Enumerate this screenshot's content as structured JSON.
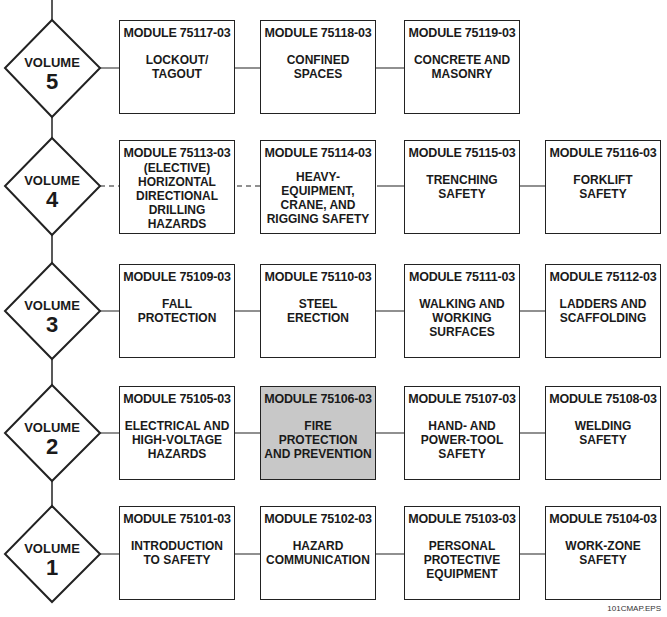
{
  "diagram": {
    "type": "course-map",
    "volumes": [
      {
        "label": "VOLUME",
        "number": "5",
        "modules": [
          {
            "code": "MODULE 75117-03",
            "title": "LOCKOUT/\nTAGOUT"
          },
          {
            "code": "MODULE 75118-03",
            "title": "CONFINED\nSPACES"
          },
          {
            "code": "MODULE 75119-03",
            "title": "CONCRETE AND\nMASONRY"
          }
        ]
      },
      {
        "label": "VOLUME",
        "number": "4",
        "modules": [
          {
            "code": "MODULE 75113-03",
            "title": "(ELECTIVE)\nHORIZONTAL\nDIRECTIONAL\nDRILLING\nHAZARDS",
            "elective": true
          },
          {
            "code": "MODULE 75114-03",
            "title": "HEAVY-\nEQUIPMENT,\nCRANE, AND\nRIGGING SAFETY"
          },
          {
            "code": "MODULE 75115-03",
            "title": "TRENCHING\nSAFETY"
          },
          {
            "code": "MODULE 75116-03",
            "title": "FORKLIFT\nSAFETY"
          }
        ]
      },
      {
        "label": "VOLUME",
        "number": "3",
        "modules": [
          {
            "code": "MODULE 75109-03",
            "title": "FALL\nPROTECTION"
          },
          {
            "code": "MODULE 75110-03",
            "title": "STEEL\nERECTION"
          },
          {
            "code": "MODULE 75111-03",
            "title": "WALKING AND\nWORKING\nSURFACES"
          },
          {
            "code": "MODULE 75112-03",
            "title": "LADDERS AND\nSCAFFOLDING"
          }
        ]
      },
      {
        "label": "VOLUME",
        "number": "2",
        "modules": [
          {
            "code": "MODULE 75105-03",
            "title": "ELECTRICAL AND\nHIGH-VOLTAGE\nHAZARDS"
          },
          {
            "code": "MODULE 75106-03",
            "title": "FIRE\nPROTECTION\nAND PREVENTION",
            "highlighted": true
          },
          {
            "code": "MODULE 75107-03",
            "title": "HAND- AND\nPOWER-TOOL\nSAFETY"
          },
          {
            "code": "MODULE 75108-03",
            "title": "WELDING\nSAFETY"
          }
        ]
      },
      {
        "label": "VOLUME",
        "number": "1",
        "modules": [
          {
            "code": "MODULE 75101-03",
            "title": "INTRODUCTION\nTO SAFETY"
          },
          {
            "code": "MODULE 75102-03",
            "title": "HAZARD\nCOMMUNICATION"
          },
          {
            "code": "MODULE 75103-03",
            "title": "PERSONAL\nPROTECTIVE\nEQUIPMENT"
          },
          {
            "code": "MODULE 75104-03",
            "title": "WORK-ZONE\nSAFETY"
          }
        ]
      }
    ],
    "highlight_color": "#c8c8c8",
    "footer": "101CMAP.EPS"
  }
}
